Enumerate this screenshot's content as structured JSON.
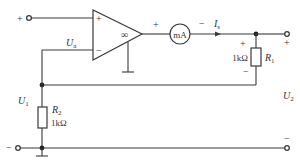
{
  "circuit": {
    "opamp": {
      "plus": "+",
      "minus": "−",
      "gain": "∞"
    },
    "meter": {
      "label": "mA",
      "plus": "+",
      "minus": "−"
    },
    "current": {
      "symbol": "I",
      "sub": "s"
    },
    "node_voltage": {
      "symbol": "U",
      "sub": "a"
    },
    "r1": {
      "symbol": "R",
      "sub": "1",
      "value": "1kΩ",
      "plus": "+",
      "minus": "−"
    },
    "r2": {
      "symbol": "R",
      "sub": "2",
      "value": "1kΩ"
    },
    "input": {
      "symbol": "U",
      "sub": "1",
      "plus": "+",
      "minus": "−"
    },
    "output": {
      "symbol": "U",
      "sub": "2",
      "plus": "+",
      "minus": "−"
    },
    "opamp_out_plus": "+"
  }
}
